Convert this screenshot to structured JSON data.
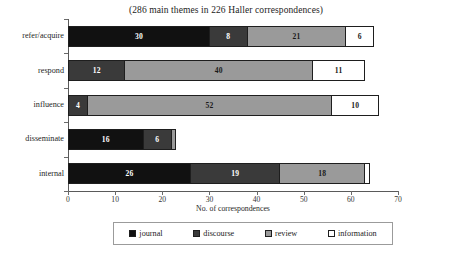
{
  "chart_data": {
    "type": "bar",
    "orientation": "horizontal",
    "stacked": true,
    "title": "(286 main themes in 226 Haller correspondences)",
    "xlabel": "No. of correspondences",
    "ylabel": "",
    "xlim": [
      0,
      70
    ],
    "xticks": [
      0,
      10,
      20,
      30,
      40,
      50,
      60,
      70
    ],
    "grid": false,
    "legend_position": "bottom",
    "categories": [
      "refer/acquire",
      "respond",
      "influence",
      "disseminate",
      "internal"
    ],
    "series": [
      {
        "name": "journal",
        "color": "#111111",
        "values": [
          30,
          0,
          0,
          16,
          26
        ]
      },
      {
        "name": "discourse",
        "color": "#3a3a3a",
        "values": [
          8,
          12,
          4,
          6,
          19
        ]
      },
      {
        "name": "review",
        "color": "#9a9a9a",
        "values": [
          21,
          40,
          52,
          1,
          18
        ]
      },
      {
        "name": "information",
        "color": "#ffffff",
        "values": [
          6,
          11,
          10,
          0,
          1
        ]
      }
    ],
    "bars": [
      {
        "category": "refer/acquire",
        "total": 65,
        "segments": [
          {
            "series": "journal",
            "value": 30,
            "label": "30",
            "color": "#111111",
            "label_color": "light",
            "label_visible": true
          },
          {
            "series": "discourse",
            "value": 8,
            "label": "8",
            "color": "#3a3a3a",
            "label_color": "light",
            "label_visible": true
          },
          {
            "series": "review",
            "value": 21,
            "label": "21",
            "color": "#9a9a9a",
            "label_color": "dark",
            "label_visible": true
          },
          {
            "series": "information",
            "value": 6,
            "label": "6",
            "color": "#ffffff",
            "label_color": "dark",
            "label_visible": true
          }
        ]
      },
      {
        "category": "respond",
        "total": 63,
        "segments": [
          {
            "series": "discourse",
            "value": 12,
            "label": "12",
            "color": "#3a3a3a",
            "label_color": "light",
            "label_visible": true
          },
          {
            "series": "review",
            "value": 40,
            "label": "40",
            "color": "#9a9a9a",
            "label_color": "dark",
            "label_visible": true
          },
          {
            "series": "information",
            "value": 11,
            "label": "11",
            "color": "#ffffff",
            "label_color": "dark",
            "label_visible": true
          }
        ]
      },
      {
        "category": "influence",
        "total": 66,
        "segments": [
          {
            "series": "discourse",
            "value": 4,
            "label": "4",
            "color": "#3a3a3a",
            "label_color": "light",
            "label_visible": true
          },
          {
            "series": "review",
            "value": 52,
            "label": "52",
            "color": "#9a9a9a",
            "label_color": "dark",
            "label_visible": true
          },
          {
            "series": "information",
            "value": 10,
            "label": "10",
            "color": "#ffffff",
            "label_color": "dark",
            "label_visible": true
          }
        ]
      },
      {
        "category": "disseminate",
        "total": 23,
        "segments": [
          {
            "series": "journal",
            "value": 16,
            "label": "16",
            "color": "#111111",
            "label_color": "light",
            "label_visible": true
          },
          {
            "series": "discourse",
            "value": 6,
            "label": "6",
            "color": "#3a3a3a",
            "label_color": "light",
            "label_visible": true
          },
          {
            "series": "review",
            "value": 1,
            "label": "",
            "color": "#9a9a9a",
            "label_color": "dark",
            "label_visible": false
          }
        ]
      },
      {
        "category": "internal",
        "total": 64,
        "segments": [
          {
            "series": "journal",
            "value": 26,
            "label": "26",
            "color": "#111111",
            "label_color": "light",
            "label_visible": true
          },
          {
            "series": "discourse",
            "value": 19,
            "label": "19",
            "color": "#3a3a3a",
            "label_color": "light",
            "label_visible": true
          },
          {
            "series": "review",
            "value": 18,
            "label": "18",
            "color": "#9a9a9a",
            "label_color": "dark",
            "label_visible": true
          },
          {
            "series": "information",
            "value": 1,
            "label": "",
            "color": "#ffffff",
            "label_color": "dark",
            "label_visible": false
          }
        ]
      }
    ],
    "legend": [
      {
        "label": "journal",
        "color": "#111111"
      },
      {
        "label": "discourse",
        "color": "#3a3a3a"
      },
      {
        "label": "review",
        "color": "#9a9a9a"
      },
      {
        "label": "information",
        "color": "#ffffff"
      }
    ]
  }
}
